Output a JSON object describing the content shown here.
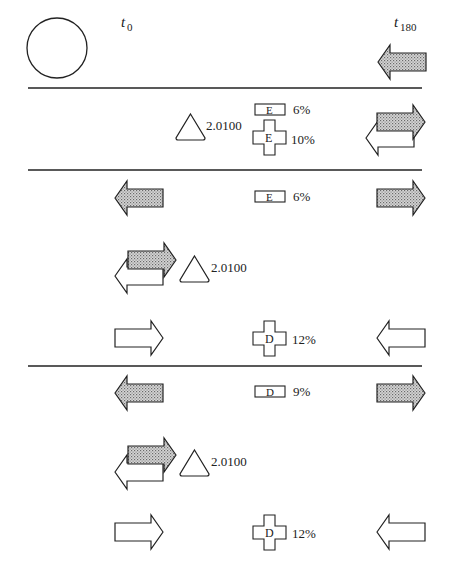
{
  "labels": {
    "t0": "t",
    "t0_sub": "0",
    "t180": "t",
    "t180_sub": "180"
  },
  "colors": {
    "stroke": "#222222",
    "hatch_fill": "#b8b8b8",
    "background": "#ffffff"
  },
  "rows": [
    {
      "id": "row1",
      "items": [
        {
          "shape": "circle",
          "name": "start-circle"
        },
        {
          "shape": "arrow-left-grey",
          "name": "right-arrow-left-grey"
        }
      ]
    },
    {
      "id": "row2",
      "triangle_value": "2.0100",
      "rect_letter": "E",
      "rect_pct": "6%",
      "cross_letter": "E",
      "cross_pct": "10%"
    },
    {
      "id": "row3",
      "rect_letter": "E",
      "rect_pct": "6%",
      "triangle_value": "2.0100",
      "cross_letter": "D",
      "cross_pct": "12%"
    },
    {
      "id": "row4",
      "rect_letter": "D",
      "rect_pct": "9%",
      "triangle_value": "2.0100",
      "cross_letter": "D",
      "cross_pct": "12%"
    }
  ]
}
